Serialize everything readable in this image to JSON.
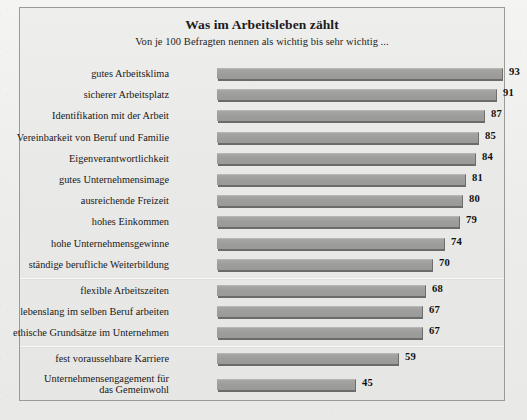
{
  "chart_data": {
    "type": "bar",
    "orientation": "horizontal",
    "title": "Was im Arbeitsleben zählt",
    "subtitle": "Von je 100 Befragten nennen als wichtig bis sehr wichtig ...",
    "xlabel": "",
    "ylabel": "",
    "xlim": [
      0,
      100
    ],
    "grid": false,
    "legend": false,
    "value_suffix": "",
    "categories": [
      "gutes Arbeitsklima",
      "sicherer Arbeitsplatz",
      "Identifikation mit der Arbeit",
      "Vereinbarkeit von Beruf und Familie",
      "Eigenverantwortlichkeit",
      "gutes Unternehmensimage",
      "ausreichende Freizeit",
      "hohes Einkommen",
      "hohe Unternehmensgewinne",
      "ständige berufliche Weiterbildung",
      "flexible Arbeitszeiten",
      "lebenslang im selben Beruf arbeiten",
      "ethische Grundsätze im Unternehmen",
      "fest voraussehbare Karriere",
      "Unternehmensengagement für das Gemeinwohl"
    ],
    "values": [
      93,
      91,
      87,
      85,
      84,
      81,
      80,
      79,
      74,
      70,
      68,
      67,
      67,
      59,
      45
    ],
    "bars": [
      {
        "label": "gutes Arbeitsklima",
        "value": 93,
        "value_text": "93",
        "lines": [
          "gutes Arbeitsklima"
        ]
      },
      {
        "label": "sicherer Arbeitsplatz",
        "value": 91,
        "value_text": "91",
        "lines": [
          "sicherer Arbeitsplatz"
        ]
      },
      {
        "label": "Identifikation mit der Arbeit",
        "value": 87,
        "value_text": "87",
        "lines": [
          "Identifikation mit der Arbeit"
        ]
      },
      {
        "label": "Vereinbarkeit von Beruf und Familie",
        "value": 85,
        "value_text": "85",
        "lines": [
          "Vereinbarkeit von Beruf und Familie"
        ]
      },
      {
        "label": "Eigenverantwortlichkeit",
        "value": 84,
        "value_text": "84",
        "lines": [
          "Eigenverantwortlichkeit"
        ]
      },
      {
        "label": "gutes Unternehmensimage",
        "value": 81,
        "value_text": "81",
        "lines": [
          "gutes Unternehmensimage"
        ]
      },
      {
        "label": "ausreichende Freizeit",
        "value": 80,
        "value_text": "80",
        "lines": [
          "ausreichende Freizeit"
        ]
      },
      {
        "label": "hohes Einkommen",
        "value": 79,
        "value_text": "79",
        "lines": [
          "hohes Einkommen"
        ]
      },
      {
        "label": "hohe Unternehmensgewinne",
        "value": 74,
        "value_text": "74",
        "lines": [
          "hohe Unternehmensgewinne"
        ]
      },
      {
        "label": "ständige berufliche Weiterbildung",
        "value": 70,
        "value_text": "70",
        "lines": [
          "ständige berufliche Weiterbildung"
        ]
      },
      {
        "label": "flexible Arbeitszeiten",
        "value": 68,
        "value_text": "68",
        "lines": [
          "flexible Arbeitszeiten"
        ]
      },
      {
        "label": "lebenslang im selben Beruf arbeiten",
        "value": 67,
        "value_text": "67",
        "lines": [
          "lebenslang im selben Beruf arbeiten"
        ]
      },
      {
        "label": "ethische Grundsätze im Unternehmen",
        "value": 67,
        "value_text": "67",
        "lines": [
          "ethische Grundsätze im Unternehmen"
        ]
      },
      {
        "label": "fest voraussehbare Karriere",
        "value": 59,
        "value_text": "59",
        "lines": [
          "fest voraussehbare Karriere"
        ]
      },
      {
        "label": "Unternehmensengagement für das Gemeinwohl",
        "value": 45,
        "value_text": "45",
        "lines": [
          "Unternehmensengagement für",
          "das Gemeinwohl"
        ]
      }
    ],
    "separators_after": [
      9,
      12
    ],
    "colors": {
      "bar_fill": "#9d9d9b",
      "bar_shadow": "#6b6b69",
      "panel_background": "#e9e9e7",
      "page_background": "#f2f2f0",
      "frame_border": "#9a9a98",
      "text": "#181818"
    }
  }
}
